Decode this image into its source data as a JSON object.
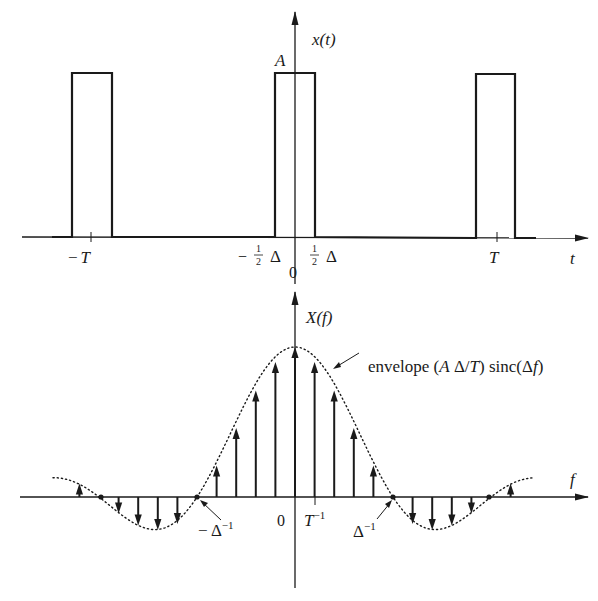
{
  "top_plot": {
    "y_axis_label": "x(t)",
    "x_axis_label": "t",
    "amplitude_label": "A",
    "origin_label": "0",
    "ticks": {
      "neg_T": "−T",
      "pos_T": "T",
      "neg_half_delta": "−½ Δ",
      "pos_half_delta": "½ Δ"
    },
    "description": "Periodic rectangular pulse train, amplitude A, pulse width Δ, period T"
  },
  "bottom_plot": {
    "y_axis_label": "X(f)",
    "x_axis_label": "f",
    "origin_label": "0",
    "envelope_annotation": "envelope (A Δ/T) sinc(Δf)",
    "ticks": {
      "inv_T": "T⁻¹",
      "neg_inv_delta": "−Δ⁻¹",
      "pos_inv_delta": "Δ⁻¹"
    },
    "description": "Line spectrum: impulses at multiples of 1/T weighted by sinc envelope with zeros at multiples of 1/Δ"
  },
  "chart_data": [
    {
      "type": "line",
      "title": "x(t)",
      "xlabel": "t",
      "ylabel": "x(t)",
      "x_ticks": [
        "−T",
        "−½Δ",
        "0",
        "½Δ",
        "T"
      ],
      "pulses": [
        {
          "center": "-T",
          "width": "Δ",
          "height": "A"
        },
        {
          "center": "0",
          "width": "Δ",
          "height": "A"
        },
        {
          "center": "T",
          "width": "Δ",
          "height": "A"
        }
      ],
      "duty_ratio_delta_over_T": 0.2
    },
    {
      "type": "stem",
      "title": "X(f)",
      "xlabel": "f",
      "ylabel": "X(f)",
      "x_ticks": [
        "−Δ⁻¹",
        "0",
        "T⁻¹",
        "Δ⁻¹"
      ],
      "harmonic_index": [
        -11,
        -10,
        -9,
        -8,
        -7,
        -6,
        -5,
        -4,
        -3,
        -2,
        -1,
        0,
        1,
        2,
        3,
        4,
        5,
        6,
        7,
        8,
        9,
        10,
        11
      ],
      "normalized_values": [
        0.09,
        0,
        -0.11,
        -0.19,
        -0.22,
        -0.18,
        0,
        0.21,
        0.46,
        0.71,
        0.9,
        1.0,
        0.9,
        0.71,
        0.46,
        0.21,
        0,
        -0.18,
        -0.22,
        -0.19,
        -0.11,
        0,
        0.09
      ],
      "envelope": "(AΔ/T) sinc(Δf)",
      "zero_crossings": [
        "−Δ⁻¹",
        "Δ⁻¹",
        "±2Δ⁻¹"
      ]
    }
  ]
}
